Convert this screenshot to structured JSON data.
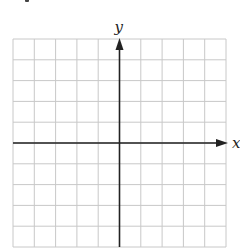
{
  "diagram": {
    "type": "coordinate-grid",
    "grid": {
      "columns": 10,
      "rows": 10,
      "line_color": "#c8c8c8"
    },
    "axes": {
      "x_label": "x",
      "y_label": "y",
      "axis_color": "#222222",
      "origin_column": 5,
      "origin_row": 5
    }
  }
}
